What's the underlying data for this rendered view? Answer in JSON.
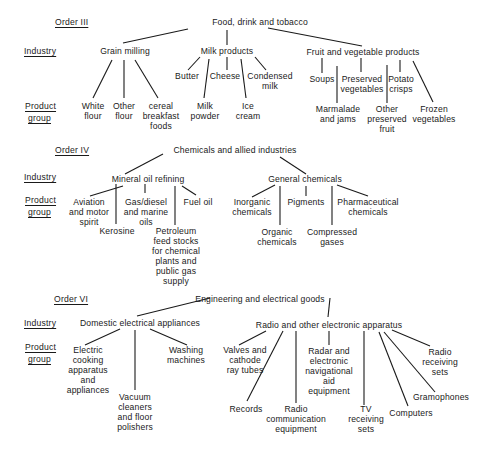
{
  "row_labels": {
    "order_iii": "Order III",
    "order_iv": "Order IV",
    "order_vi": "Order VI",
    "industry": "Industry",
    "product": "Product",
    "group": "group"
  },
  "order_iii": {
    "title": "Food, drink and tobacco",
    "industries": {
      "grain": "Grain milling",
      "milk": "Milk products",
      "fruit": "Fruit and vegetable products"
    },
    "products": {
      "white_flour": "White\nflour",
      "other_flour": "Other\nflour",
      "cereal": "cereal\nbreakfast\nfoods",
      "butter": "Butter",
      "cheese": "Cheese",
      "condensed": "Condensed\nmilk",
      "milk_powder": "Milk\npowder",
      "ice_cream": "Ice\ncream",
      "soups": "Soups",
      "preserved_veg": "Preserved\nvegetables",
      "potato": "Potato\ncrisps",
      "marmalade": "Marmalade\nand jams",
      "other_fruit": "Other\npreserved\nfruit",
      "frozen": "Frozen\nvegetables"
    }
  },
  "order_iv": {
    "title": "Chemicals and allied industries",
    "industries": {
      "mineral": "Mineral oil refining",
      "general": "General chemicals"
    },
    "products": {
      "aviation": "Aviation\nand motor\nspirit",
      "gasdiesel": "Gas/diesel\nand marine\noils",
      "fuel_oil": "Fuel oil",
      "kerosine": "Kerosine",
      "petroleum": "Petroleum\nfeed stocks\nfor chemical\nplants and\npublic gas\nsupply",
      "inorganic": "Inorganic\nchemicals",
      "pigments": "Pigments",
      "pharma": "Pharmaceutical\nchemicals",
      "organic": "Organic\nchemicals",
      "compressed": "Compressed\ngases"
    }
  },
  "order_vi": {
    "title": "Engineering and electrical goods",
    "industries": {
      "domestic": "Domestic electrical appliances",
      "radio": "Radio and other electronic apparatus"
    },
    "products": {
      "electric_cooking": "Electric\ncooking\napparatus\nand\nappliances",
      "washing": "Washing\nmachines",
      "vacuum": "Vacuum\ncleaners\nand floor\npolishers",
      "valves": "Valves and\ncathode\nray tubes",
      "radar": "Radar and\nelectronic\nnavigational\naid\nequipment",
      "radio_receiving": "Radio\nreceiving\nsets",
      "gramophones": "Gramophones",
      "records": "Records",
      "radio_comm": "Radio\ncommunication\nequipment",
      "tv": "TV\nreceiving\nsets",
      "computers": "Computers"
    }
  }
}
